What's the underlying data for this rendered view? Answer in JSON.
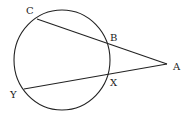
{
  "diagram": {
    "type": "geometry",
    "circle": {
      "cx": 63,
      "cy": 60,
      "r": 48
    },
    "points": {
      "A": {
        "label": "A",
        "x": 168,
        "y": 64
      },
      "B": {
        "label": "B",
        "x": 107,
        "y": 43
      },
      "C": {
        "label": "C",
        "x": 37,
        "y": 19
      },
      "X": {
        "label": "X",
        "x": 108,
        "y": 74
      },
      "Y": {
        "label": "Y",
        "x": 24,
        "y": 89
      }
    },
    "segments": [
      [
        "C",
        "A"
      ],
      [
        "Y",
        "A"
      ]
    ]
  }
}
